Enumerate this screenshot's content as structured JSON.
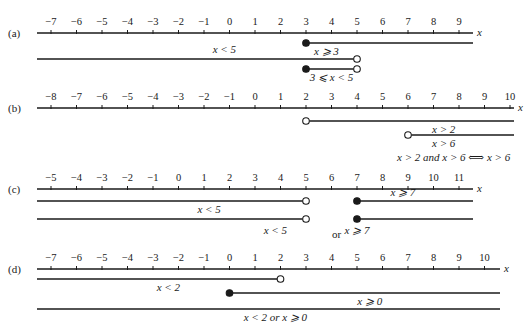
{
  "figure": {
    "width": 529,
    "height": 333,
    "colors": {
      "ink": "#1a1a1a",
      "background": "#ffffff"
    },
    "axis_variable": "x",
    "tick_spacing_px": 25.5,
    "panels": [
      {
        "id": "a",
        "label": "(a)",
        "axis_y": 33,
        "tick_min": -7,
        "tick_max": 9,
        "origin_px": 51,
        "first_tick": -7,
        "axis_end_px": 473,
        "rays": [
          {
            "label": "x ⩾ 3",
            "y": 43,
            "from": 3,
            "from_closed": true,
            "to": null,
            "label_x": 3.8,
            "label_dy": 12
          },
          {
            "label": "x < 5",
            "y": 59,
            "from": null,
            "to": 5,
            "to_closed": false,
            "label_x": -0.2,
            "label_dy": -6
          },
          {
            "label": "3 ⩽ x < 5",
            "y": 69,
            "from": 3,
            "from_closed": true,
            "to": 5,
            "to_closed": false,
            "label_x": 4.0,
            "label_dy": 12
          }
        ],
        "statements": []
      },
      {
        "id": "b",
        "label": "(b)",
        "axis_y": 108,
        "tick_min": -8,
        "tick_max": 10,
        "origin_px": 51,
        "first_tick": -8,
        "axis_end_px": 514,
        "rays": [
          {
            "label": "x > 2",
            "y": 121,
            "from": 2,
            "from_closed": false,
            "to": null,
            "label_x": 7.4,
            "label_dy": 12
          },
          {
            "label": "x > 6",
            "y": 135,
            "from": 6,
            "from_closed": false,
            "to": null,
            "label_x": 7.4,
            "label_dy": 12
          }
        ],
        "statements": [
          {
            "text": "x > 2 and x > 6 ⟺ x > 6",
            "x": 397,
            "y": 161
          }
        ]
      },
      {
        "id": "c",
        "label": "(c)",
        "axis_y": 189,
        "tick_min": -5,
        "tick_max": 11,
        "origin_px": 51,
        "first_tick": -5,
        "axis_end_px": 473,
        "rays": [
          {
            "label": "x < 5",
            "y": 201,
            "from": null,
            "to": 5,
            "to_closed": false,
            "label_x": 1.2,
            "label_dy": 12
          },
          {
            "label": "x ⩾ 7",
            "y": 201,
            "from": 7,
            "from_closed": true,
            "to": null,
            "label_x": 8.8,
            "label_dy": -5
          },
          {
            "label": "x < 5",
            "y": 219,
            "from": null,
            "to": 5,
            "to_closed": false,
            "label_x": 3.8,
            "label_dy": 15
          },
          {
            "label": "x ⩾ 7",
            "y": 219,
            "from": 7,
            "from_closed": true,
            "to": null,
            "label_x": 7.0,
            "label_dy": 15
          }
        ],
        "statements": [
          {
            "text": "or",
            "x": 332,
            "y": 238
          }
        ]
      },
      {
        "id": "d",
        "label": "(d)",
        "axis_y": 269,
        "tick_min": -7,
        "tick_max": 10,
        "origin_px": 51,
        "first_tick": -7,
        "axis_end_px": 500,
        "rays": [
          {
            "label": "x < 2",
            "y": 279,
            "from": null,
            "to": 2,
            "to_closed": false,
            "label_x": -2.4,
            "label_dy": 12
          },
          {
            "label": "x ⩾ 0",
            "y": 293,
            "from": 0,
            "from_closed": true,
            "to": null,
            "label_x": 5.5,
            "label_dy": 12
          },
          {
            "label": "x < 2  or  x ⩾ 0",
            "y": 309,
            "from": null,
            "to": null,
            "label_x": 1.8,
            "label_dy": 12
          }
        ],
        "statements": []
      }
    ]
  }
}
